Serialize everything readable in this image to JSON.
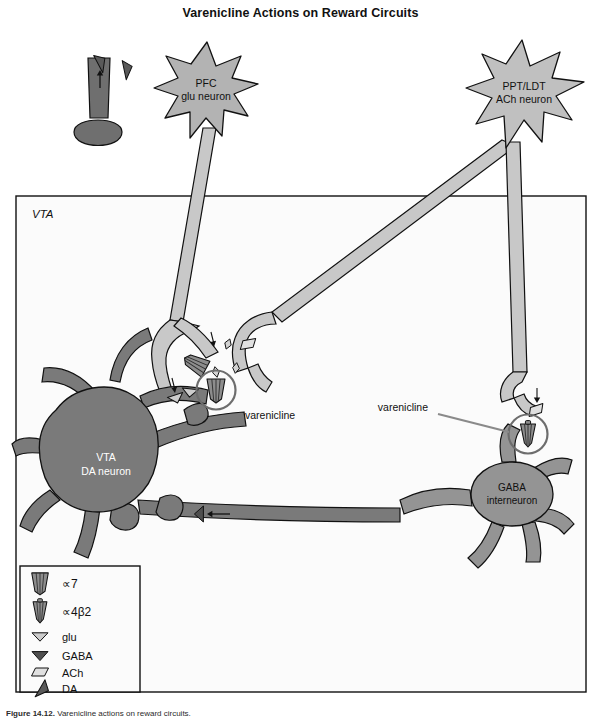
{
  "figure": {
    "title": "Varenicline Actions on Reward Circuits",
    "caption_bold": "Figure 14.12.",
    "caption_rest": "Varenicline actions on reward circuits."
  },
  "vta_box": {
    "label": "VTA"
  },
  "neurons": [
    {
      "id": "pfc-glu-neuron",
      "line1": "PFC",
      "line2": "glu neuron",
      "fill": "#b3b3b3",
      "text_color": "#111111"
    },
    {
      "id": "ppt-ldt-ach-neuron",
      "line1": "PPT/LDT",
      "line2": "ACh neuron",
      "fill": "#c0c0c0",
      "text_color": "#111111"
    },
    {
      "id": "vta-da-neuron",
      "line1": "VTA",
      "line2": "DA neuron",
      "fill": "#7a7a7a",
      "text_color": "#ffffff"
    },
    {
      "id": "gaba-interneuron",
      "line1": "GABA",
      "line2": "interneuron",
      "fill": "#949494",
      "text_color": "#111111"
    }
  ],
  "annotations": [
    {
      "id": "varenicline-left",
      "label": "varenicline"
    },
    {
      "id": "varenicline-right",
      "label": "varenicline"
    }
  ],
  "legend": {
    "items": [
      {
        "key": "alpha7",
        "label": "∝7",
        "icon": "alpha7-receptor-icon"
      },
      {
        "key": "alpha4b2",
        "label": "∝4β2",
        "icon": "alpha4beta2-receptor-icon"
      },
      {
        "key": "glu",
        "label": "glu",
        "icon": "glu-vesicle-icon"
      },
      {
        "key": "gaba",
        "label": "GABA",
        "icon": "gaba-vesicle-icon"
      },
      {
        "key": "ach",
        "label": "ACh",
        "icon": "ach-vesicle-icon"
      },
      {
        "key": "da",
        "label": "DA",
        "icon": "da-vesicle-icon"
      }
    ]
  },
  "colors": {
    "dark_neuron": "#7a7a7a",
    "mid_neuron": "#949494",
    "light_neuron": "#b3b3b3",
    "pale_axon": "#c8c8c8",
    "da_vesicle": "#5a5a5a",
    "gaba_vesicle": "#555555",
    "glu_vesicle": "#c9c9c9",
    "ach_vesicle": "#dcdcdc",
    "outline": "#111111",
    "vta_background": "#fbfbfb"
  }
}
